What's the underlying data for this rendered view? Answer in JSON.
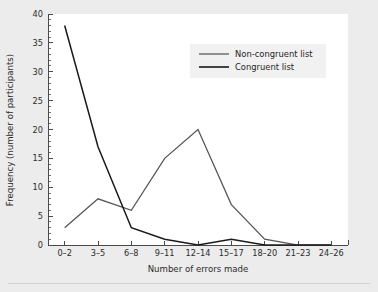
{
  "chart_data": {
    "type": "line",
    "title": "",
    "xlabel": "Number of errors made",
    "ylabel": "Frequency (number of participants)",
    "categories": [
      "0–2",
      "3–5",
      "6–8",
      "9–11",
      "12–14",
      "15–17",
      "18–20",
      "21–23",
      "24–26"
    ],
    "series": [
      {
        "name": "Non-congruent list",
        "color": "#555555",
        "values": [
          3,
          8,
          6,
          15,
          20,
          7,
          1,
          0,
          0
        ]
      },
      {
        "name": "Congruent list",
        "color": "#1a1a1a",
        "values": [
          38,
          17,
          3,
          1,
          0,
          1,
          0,
          0,
          0
        ]
      }
    ],
    "ylim": [
      0,
      40
    ],
    "yticks": [
      0,
      5,
      10,
      15,
      20,
      25,
      30,
      35,
      40
    ],
    "ytick_labels": [
      "0",
      "5",
      "10",
      "15",
      "20",
      "25",
      "30",
      "35",
      "40"
    ],
    "y_minor_step": 1,
    "grid": false,
    "legend_position": "top-right"
  },
  "legend": {
    "entries": [
      {
        "label": "Non-congruent list"
      },
      {
        "label": "Congruent list"
      }
    ]
  },
  "colors": {
    "page_background": "#ececec",
    "plot_background": "#ffffff",
    "axis": "#4a4a4a",
    "text": "#2b2b2b",
    "legend_background": "#f1f1f1",
    "footer_rule": "#d2d2d2"
  }
}
